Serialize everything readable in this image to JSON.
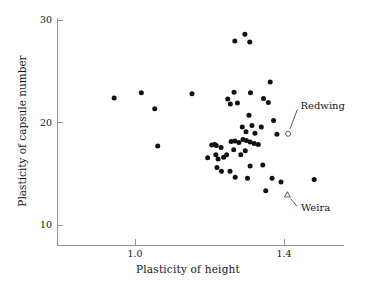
{
  "chart_data": {
    "type": "scatter",
    "title": "",
    "xlabel": "Plasticity of height",
    "ylabel": "Plasticity of capsule number",
    "xlim": [
      0.83,
      1.56
    ],
    "ylim": [
      8.9,
      30.2
    ],
    "xticks": [
      1.0,
      1.4
    ],
    "xticklabels": [
      "1.0",
      "1.4"
    ],
    "yticks": [
      10,
      20,
      30
    ],
    "yticklabels": [
      "10",
      "20",
      "30"
    ],
    "grid": false,
    "legend": false,
    "marker_color": "#111111",
    "axis_color": "#8a8a8a",
    "series": [
      {
        "name": "populations",
        "marker": "filled-circle",
        "points": [
          [
            0.944,
            22.4
          ],
          [
            1.017,
            22.9
          ],
          [
            1.053,
            21.35
          ],
          [
            1.153,
            22.8
          ],
          [
            1.061,
            17.7
          ],
          [
            1.268,
            27.95
          ],
          [
            1.295,
            28.6
          ],
          [
            1.308,
            27.85
          ],
          [
            1.363,
            23.95
          ],
          [
            1.266,
            22.95
          ],
          [
            1.31,
            22.9
          ],
          [
            1.249,
            22.3
          ],
          [
            1.275,
            21.9
          ],
          [
            1.345,
            22.35
          ],
          [
            1.256,
            21.8
          ],
          [
            1.358,
            21.95
          ],
          [
            1.306,
            20.7
          ],
          [
            1.314,
            19.7
          ],
          [
            1.288,
            19.55
          ],
          [
            1.339,
            19.55
          ],
          [
            1.372,
            20.2
          ],
          [
            1.381,
            18.85
          ],
          [
            1.298,
            19.1
          ],
          [
            1.322,
            18.95
          ],
          [
            1.214,
            17.85
          ],
          [
            1.218,
            17.75
          ],
          [
            1.231,
            17.55
          ],
          [
            1.258,
            18.15
          ],
          [
            1.268,
            18.2
          ],
          [
            1.279,
            18.05
          ],
          [
            1.29,
            18.35
          ],
          [
            1.299,
            18.25
          ],
          [
            1.309,
            18.1
          ],
          [
            1.32,
            17.95
          ],
          [
            1.331,
            17.85
          ],
          [
            1.217,
            16.85
          ],
          [
            1.223,
            16.45
          ],
          [
            1.246,
            16.85
          ],
          [
            1.284,
            16.85
          ],
          [
            1.296,
            17.25
          ],
          [
            1.265,
            17.35
          ],
          [
            1.238,
            16.6
          ],
          [
            1.195,
            16.55
          ],
          [
            1.22,
            15.6
          ],
          [
            1.232,
            15.25
          ],
          [
            1.255,
            15.25
          ],
          [
            1.269,
            14.65
          ],
          [
            1.309,
            15.75
          ],
          [
            1.343,
            15.85
          ],
          [
            1.302,
            14.55
          ],
          [
            1.368,
            14.55
          ],
          [
            1.392,
            14.2
          ],
          [
            1.481,
            14.45
          ],
          [
            1.351,
            13.35
          ],
          [
            1.206,
            17.8
          ]
        ]
      },
      {
        "name": "Redwing",
        "marker": "open-circle",
        "points": [
          [
            1.411,
            18.9
          ]
        ]
      },
      {
        "name": "Weira",
        "marker": "open-triangle",
        "points": [
          [
            1.409,
            12.95
          ]
        ]
      }
    ],
    "annotations": [
      {
        "text": "Redwing",
        "target": [
          1.411,
          18.9
        ],
        "label_x": 1.439,
        "label_y": 21.55,
        "leader": true
      },
      {
        "text": "Weira",
        "target": [
          1.409,
          12.95
        ],
        "label_x": 1.44,
        "label_y": 11.6,
        "leader": true
      }
    ]
  }
}
